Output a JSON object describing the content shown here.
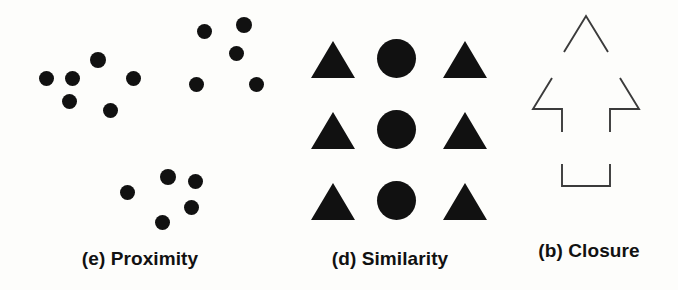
{
  "figure": {
    "background_color": "#fdfdfb",
    "ink_color": "#111111",
    "line_color": "#3b3b3b",
    "panels": [
      {
        "id": "proximity",
        "caption": "(e) Proximity",
        "principle": "Proximity",
        "label_letter": "(e)",
        "shape_kind": "dot",
        "clusters": [
          {
            "name": "upper-left-cluster",
            "dot_count": 6,
            "dots": [
              {
                "cx": 46,
                "cy": 78,
                "d": 15
              },
              {
                "cx": 72,
                "cy": 78,
                "d": 15
              },
              {
                "cx": 69,
                "cy": 101,
                "d": 15
              },
              {
                "cx": 98,
                "cy": 60,
                "d": 16
              },
              {
                "cx": 133,
                "cy": 78,
                "d": 15
              },
              {
                "cx": 110,
                "cy": 110,
                "d": 15
              }
            ]
          },
          {
            "name": "upper-right-cluster",
            "dot_count": 5,
            "dots": [
              {
                "cx": 204,
                "cy": 31,
                "d": 15
              },
              {
                "cx": 244,
                "cy": 25,
                "d": 16
              },
              {
                "cx": 236,
                "cy": 53,
                "d": 15
              },
              {
                "cx": 196,
                "cy": 84,
                "d": 15
              },
              {
                "cx": 256,
                "cy": 84,
                "d": 15
              }
            ]
          },
          {
            "name": "lower-center-cluster",
            "dot_count": 5,
            "dots": [
              {
                "cx": 127,
                "cy": 192,
                "d": 15
              },
              {
                "cx": 168,
                "cy": 177,
                "d": 16
              },
              {
                "cx": 195,
                "cy": 181,
                "d": 15
              },
              {
                "cx": 191,
                "cy": 207,
                "d": 15
              },
              {
                "cx": 162,
                "cy": 222,
                "d": 15
              }
            ]
          }
        ]
      },
      {
        "id": "similarity",
        "caption": "(d) Similarity",
        "principle": "Similarity",
        "label_letter": "(d)",
        "grid": {
          "rows": 3,
          "columns": 3,
          "column_shapes": [
            "triangle",
            "circle",
            "triangle"
          ],
          "column_centers": [
            53,
            116,
            185
          ],
          "row_tops": [
            41,
            112,
            183
          ],
          "triangle_width": 44,
          "triangle_height": 37,
          "circle_diameter": 39
        }
      },
      {
        "id": "closure",
        "caption": "(b) Closure",
        "principle": "Closure",
        "label_letter": "(b)",
        "outline_shape": "upward-arrow",
        "stroke_width": 1.9,
        "segments": [
          {
            "name": "apex-chevron",
            "points": "64,52 86,16 108,52"
          },
          {
            "name": "left-barb-and-stem",
            "points": "52,78 33,109 62,109 62,132"
          },
          {
            "name": "right-barb-and-stem",
            "points": "120,78 139,109 110,109 110,132"
          },
          {
            "name": "bottom-bracket",
            "points": "62,164 62,186 110,186 110,164"
          }
        ]
      }
    ]
  }
}
